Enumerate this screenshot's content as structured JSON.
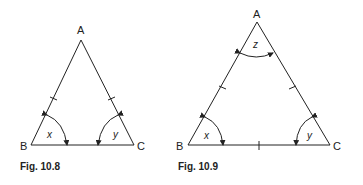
{
  "figures": [
    {
      "caption": "Fig. 10.8",
      "vertices": {
        "A": "A",
        "B": "B",
        "C": "C"
      },
      "angles": {
        "B": "x",
        "C": "y"
      },
      "description": "Isosceles triangle with AB = AC marked by tick marks; base angles x and y"
    },
    {
      "caption": "Fig. 10.9",
      "vertices": {
        "A": "A",
        "B": "B",
        "C": "C"
      },
      "angles": {
        "A": "z",
        "B": "x",
        "C": "y"
      },
      "description": "Equilateral triangle with all three sides marked by tick marks; angles x, y, z"
    }
  ]
}
